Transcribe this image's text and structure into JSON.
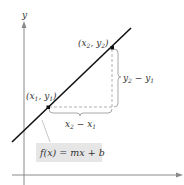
{
  "diagram": {
    "axes": {
      "y_label": "y",
      "x_label": ""
    },
    "points": [
      {
        "id": "p1",
        "label_main": "(x",
        "sub1": "1",
        "mid": ", y",
        "sub2": "1",
        "close": ")"
      },
      {
        "id": "p2",
        "label_main": "(x",
        "sub1": "2",
        "mid": ", y",
        "sub2": "2",
        "close": ")"
      }
    ],
    "run_label": {
      "a": "x",
      "a_sub": "2",
      "op": " − ",
      "b": "x",
      "b_sub": "1"
    },
    "rise_label": {
      "a": "y",
      "a_sub": "2",
      "op": " − ",
      "b": "y",
      "b_sub": "1"
    },
    "function_label": "f(x) = mx + b",
    "colors": {
      "line": "#111111",
      "axis": "#8a8a8a",
      "dashed": "#b0b0b0",
      "brace": "#a8a8a8",
      "label_box": "#e6e6e6",
      "text": "#333333"
    }
  }
}
